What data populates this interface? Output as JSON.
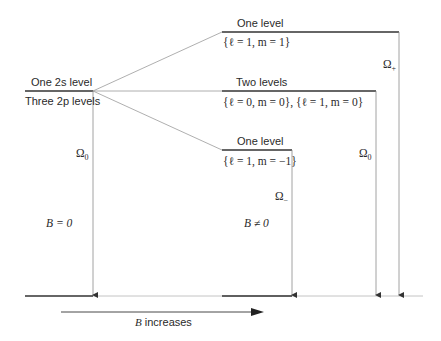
{
  "diagram": {
    "type": "energy-level-splitting",
    "colors": {
      "level_line": "#333333",
      "connector": "#9a9a9a",
      "arrow": "#8a8a8a",
      "text": "#2a2a2a"
    },
    "left": {
      "top_label": "One 2s level",
      "bottom_label": "Three 2p levels",
      "omega_label": "Ω",
      "omega_sub": "0",
      "field_label": "B = 0"
    },
    "right": {
      "upper": {
        "title": "One level",
        "quantum": "{ℓ = 1, m = 1}",
        "omega_label": "Ω",
        "omega_sub": "+"
      },
      "middle": {
        "title": "Two levels",
        "quantum": "{ℓ = 0, m = 0}, {ℓ = 1, m = 0}",
        "omega_label": "Ω",
        "omega_sub": "0"
      },
      "lower": {
        "title": "One level",
        "quantum": "{ℓ = 1, m = −1}",
        "omega_label": "Ω",
        "omega_sub": "−"
      },
      "field_label": "B ≠ 0"
    },
    "axis": {
      "label": "B increases"
    }
  }
}
